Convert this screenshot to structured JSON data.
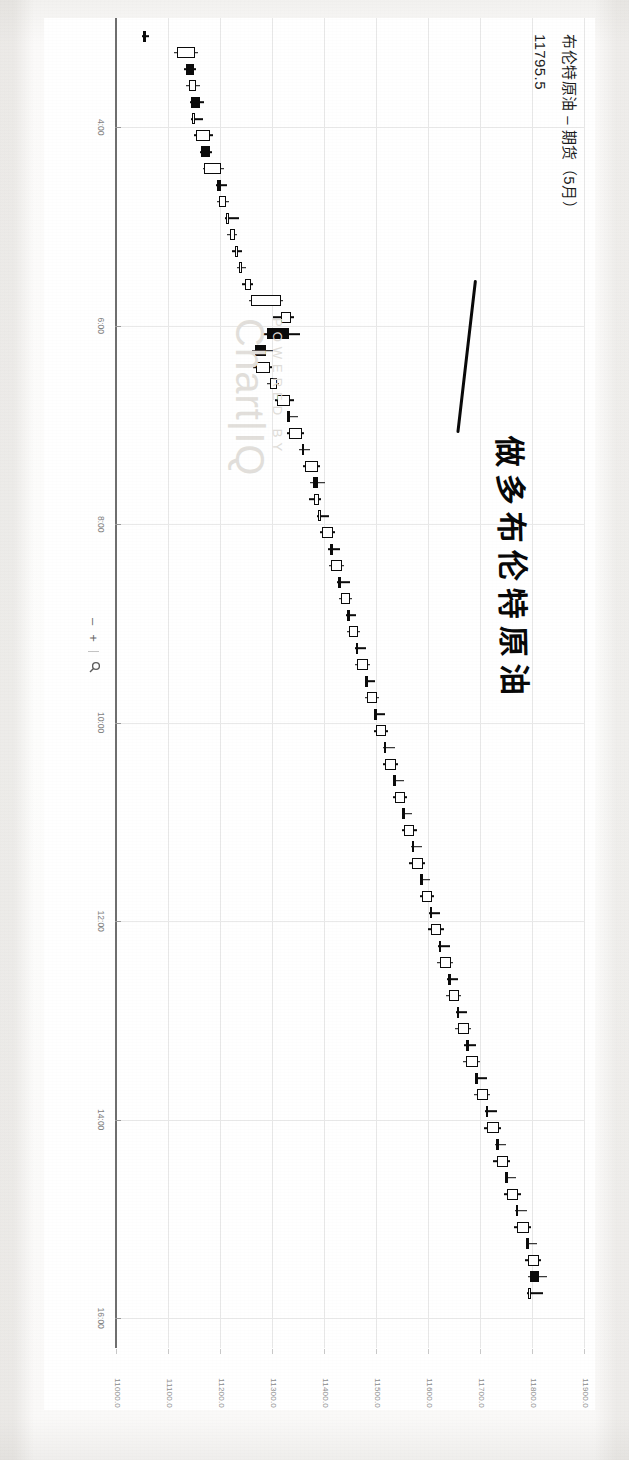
{
  "document": {
    "kind": "scanned-screenshot",
    "orientation": "rotated-90-clockwise"
  },
  "header": {
    "title": "布伦特原油 – 期货（5月）",
    "last_price": "11795.5"
  },
  "annotation": {
    "handwritten_text": "做多布伦特原油",
    "ink_color": "#0a0a0a"
  },
  "watermark": {
    "line1": "POWERED BY",
    "line2": "Chart|IQ"
  },
  "zoom_controls": {
    "minus_label": "–",
    "plus_label": "+",
    "magnifier_icon": "magnifier-icon"
  },
  "chart_data": {
    "type": "candlestick",
    "title": "布伦特原油 – 期货（5月）",
    "xlabel": "",
    "ylabel": "",
    "ylim": [
      11000.0,
      11900.0
    ],
    "grid": true,
    "legend": "none",
    "y_ticks": [
      "11900.0",
      "11800.0",
      "11700.0",
      "11600.0",
      "11500.0",
      "11400.0",
      "11300.0",
      "11200.0",
      "11100.0",
      "11000.0"
    ],
    "y_tick_values": [
      11900.0,
      11800.0,
      11700.0,
      11600.0,
      11500.0,
      11400.0,
      11300.0,
      11200.0,
      11100.0,
      11000.0
    ],
    "x_ticks": [
      "4:00",
      "6:00",
      "8:00",
      "10:00",
      "12:00",
      "14:00",
      "16:00",
      "18:00",
      "20:00",
      "22:00"
    ],
    "x_tick_values": [
      4,
      6,
      8,
      10,
      12,
      14,
      16,
      18,
      20,
      22
    ],
    "up_color": "#ffffff",
    "down_color": "#0b0b0b",
    "candles": [
      {
        "t": "3:05",
        "o": 11055,
        "h": 11062,
        "l": 11048,
        "c": 11050
      },
      {
        "t": "3:15",
        "o": 11115,
        "h": 11155,
        "l": 11110,
        "c": 11150
      },
      {
        "t": "3:25",
        "o": 11148,
        "h": 11152,
        "l": 11128,
        "c": 11132
      },
      {
        "t": "3:35",
        "o": 11138,
        "h": 11160,
        "l": 11132,
        "c": 11152
      },
      {
        "t": "3:45",
        "o": 11160,
        "h": 11168,
        "l": 11140,
        "c": 11142
      },
      {
        "t": "3:55",
        "o": 11148,
        "h": 11165,
        "l": 11142,
        "c": 11150
      },
      {
        "t": "4:05",
        "o": 11152,
        "h": 11185,
        "l": 11148,
        "c": 11178
      },
      {
        "t": "4:15",
        "o": 11178,
        "h": 11182,
        "l": 11160,
        "c": 11162
      },
      {
        "t": "4:25",
        "o": 11168,
        "h": 11205,
        "l": 11165,
        "c": 11200
      },
      {
        "t": "4:35",
        "o": 11200,
        "h": 11212,
        "l": 11190,
        "c": 11192
      },
      {
        "t": "4:45",
        "o": 11196,
        "h": 11215,
        "l": 11192,
        "c": 11210
      },
      {
        "t": "4:55",
        "o": 11212,
        "h": 11235,
        "l": 11208,
        "c": 11215
      },
      {
        "t": "5:05",
        "o": 11218,
        "h": 11230,
        "l": 11212,
        "c": 11226
      },
      {
        "t": "5:15",
        "o": 11228,
        "h": 11240,
        "l": 11222,
        "c": 11232
      },
      {
        "t": "5:25",
        "o": 11236,
        "h": 11248,
        "l": 11230,
        "c": 11240
      },
      {
        "t": "5:35",
        "o": 11246,
        "h": 11262,
        "l": 11240,
        "c": 11258
      },
      {
        "t": "5:45",
        "o": 11258,
        "h": 11320,
        "l": 11254,
        "c": 11316
      },
      {
        "t": "5:55",
        "o": 11316,
        "h": 11340,
        "l": 11300,
        "c": 11335
      },
      {
        "t": "6:05",
        "o": 11330,
        "h": 11352,
        "l": 11280,
        "c": 11288
      },
      {
        "t": "6:15",
        "o": 11286,
        "h": 11300,
        "l": 11260,
        "c": 11266
      },
      {
        "t": "6:25",
        "o": 11268,
        "h": 11298,
        "l": 11262,
        "c": 11294
      },
      {
        "t": "6:35",
        "o": 11294,
        "h": 11312,
        "l": 11288,
        "c": 11308
      },
      {
        "t": "6:45",
        "o": 11308,
        "h": 11340,
        "l": 11304,
        "c": 11332
      },
      {
        "t": "6:55",
        "o": 11332,
        "h": 11348,
        "l": 11326,
        "c": 11330
      },
      {
        "t": "7:05",
        "o": 11330,
        "h": 11360,
        "l": 11326,
        "c": 11356
      },
      {
        "t": "7:15",
        "o": 11356,
        "h": 11372,
        "l": 11350,
        "c": 11360
      },
      {
        "t": "7:25",
        "o": 11362,
        "h": 11390,
        "l": 11358,
        "c": 11386
      },
      {
        "t": "7:35",
        "o": 11386,
        "h": 11400,
        "l": 11372,
        "c": 11376
      },
      {
        "t": "7:45",
        "o": 11378,
        "h": 11392,
        "l": 11370,
        "c": 11388
      },
      {
        "t": "7:55",
        "o": 11388,
        "h": 11408,
        "l": 11384,
        "c": 11392
      },
      {
        "t": "8:05",
        "o": 11394,
        "h": 11420,
        "l": 11390,
        "c": 11416
      },
      {
        "t": "8:15",
        "o": 11416,
        "h": 11428,
        "l": 11406,
        "c": 11410
      },
      {
        "t": "8:25",
        "o": 11412,
        "h": 11436,
        "l": 11408,
        "c": 11432
      },
      {
        "t": "8:35",
        "o": 11430,
        "h": 11448,
        "l": 11424,
        "c": 11428
      },
      {
        "t": "8:45",
        "o": 11430,
        "h": 11452,
        "l": 11426,
        "c": 11448
      },
      {
        "t": "8:55",
        "o": 11448,
        "h": 11460,
        "l": 11440,
        "c": 11444
      },
      {
        "t": "9:05",
        "o": 11446,
        "h": 11468,
        "l": 11442,
        "c": 11464
      },
      {
        "t": "9:15",
        "o": 11464,
        "h": 11478,
        "l": 11458,
        "c": 11462
      },
      {
        "t": "9:25",
        "o": 11462,
        "h": 11486,
        "l": 11458,
        "c": 11482
      },
      {
        "t": "9:35",
        "o": 11482,
        "h": 11496,
        "l": 11476,
        "c": 11480
      },
      {
        "t": "9:45",
        "o": 11480,
        "h": 11504,
        "l": 11476,
        "c": 11500
      },
      {
        "t": "9:55",
        "o": 11500,
        "h": 11516,
        "l": 11494,
        "c": 11498
      },
      {
        "t": "10:05",
        "o": 11498,
        "h": 11522,
        "l": 11494,
        "c": 11518
      },
      {
        "t": "10:15",
        "o": 11518,
        "h": 11534,
        "l": 11512,
        "c": 11516
      },
      {
        "t": "10:25",
        "o": 11516,
        "h": 11540,
        "l": 11512,
        "c": 11536
      },
      {
        "t": "10:35",
        "o": 11536,
        "h": 11552,
        "l": 11530,
        "c": 11534
      },
      {
        "t": "10:45",
        "o": 11534,
        "h": 11558,
        "l": 11530,
        "c": 11554
      },
      {
        "t": "10:55",
        "o": 11554,
        "h": 11568,
        "l": 11548,
        "c": 11552
      },
      {
        "t": "11:05",
        "o": 11552,
        "h": 11576,
        "l": 11548,
        "c": 11572
      },
      {
        "t": "11:15",
        "o": 11572,
        "h": 11586,
        "l": 11566,
        "c": 11570
      },
      {
        "t": "11:25",
        "o": 11568,
        "h": 11592,
        "l": 11562,
        "c": 11588
      },
      {
        "t": "11:35",
        "o": 11588,
        "h": 11602,
        "l": 11582,
        "c": 11586
      },
      {
        "t": "11:45",
        "o": 11586,
        "h": 11610,
        "l": 11582,
        "c": 11606
      },
      {
        "t": "11:55",
        "o": 11606,
        "h": 11622,
        "l": 11600,
        "c": 11604
      },
      {
        "t": "12:05",
        "o": 11604,
        "h": 11628,
        "l": 11598,
        "c": 11624
      },
      {
        "t": "12:15",
        "o": 11624,
        "h": 11640,
        "l": 11618,
        "c": 11622
      },
      {
        "t": "12:25",
        "o": 11622,
        "h": 11646,
        "l": 11616,
        "c": 11642
      },
      {
        "t": "12:35",
        "o": 11642,
        "h": 11656,
        "l": 11634,
        "c": 11638
      },
      {
        "t": "12:45",
        "o": 11638,
        "h": 11662,
        "l": 11632,
        "c": 11658
      },
      {
        "t": "12:55",
        "o": 11658,
        "h": 11674,
        "l": 11652,
        "c": 11656
      },
      {
        "t": "13:05",
        "o": 11656,
        "h": 11680,
        "l": 11650,
        "c": 11676
      },
      {
        "t": "13:15",
        "o": 11676,
        "h": 11690,
        "l": 11668,
        "c": 11672
      },
      {
        "t": "13:25",
        "o": 11672,
        "h": 11698,
        "l": 11666,
        "c": 11694
      },
      {
        "t": "13:35",
        "o": 11694,
        "h": 11712,
        "l": 11688,
        "c": 11692
      },
      {
        "t": "13:45",
        "o": 11692,
        "h": 11718,
        "l": 11686,
        "c": 11714
      },
      {
        "t": "13:55",
        "o": 11714,
        "h": 11730,
        "l": 11708,
        "c": 11712
      },
      {
        "t": "14:05",
        "o": 11712,
        "h": 11738,
        "l": 11706,
        "c": 11734
      },
      {
        "t": "14:15",
        "o": 11734,
        "h": 11748,
        "l": 11726,
        "c": 11730
      },
      {
        "t": "14:25",
        "o": 11730,
        "h": 11756,
        "l": 11724,
        "c": 11752
      },
      {
        "t": "14:35",
        "o": 11752,
        "h": 11768,
        "l": 11746,
        "c": 11750
      },
      {
        "t": "14:45",
        "o": 11750,
        "h": 11776,
        "l": 11744,
        "c": 11772
      },
      {
        "t": "14:55",
        "o": 11772,
        "h": 11788,
        "l": 11766,
        "c": 11770
      },
      {
        "t": "15:05",
        "o": 11770,
        "h": 11796,
        "l": 11764,
        "c": 11792
      },
      {
        "t": "15:15",
        "o": 11792,
        "h": 11808,
        "l": 11786,
        "c": 11790
      },
      {
        "t": "15:25",
        "o": 11790,
        "h": 11815,
        "l": 11784,
        "c": 11812
      },
      {
        "t": "15:35",
        "o": 11812,
        "h": 11826,
        "l": 11790,
        "c": 11795
      },
      {
        "t": "15:45",
        "o": 11795,
        "h": 11820,
        "l": 11788,
        "c": 11796
      }
    ]
  }
}
